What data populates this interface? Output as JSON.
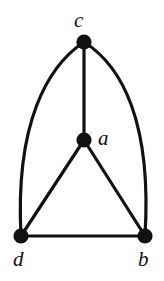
{
  "figure": {
    "kind": "undirected-graph-diagram",
    "background_color": "#ffffff",
    "ink_color": "#111111",
    "width": 164,
    "height": 281,
    "edge_stroke_width": 3.2,
    "vertex_radius": 7.6
  },
  "graph": {
    "vertices": [
      {
        "id": "c",
        "label": "c",
        "cx": 84,
        "cy": 42,
        "label_x": 74,
        "label_y": 10,
        "label_placement": "above"
      },
      {
        "id": "a",
        "label": "a",
        "cx": 84,
        "cy": 140,
        "label_x": 98,
        "label_y": 128,
        "label_placement": "right"
      },
      {
        "id": "d",
        "label": "d",
        "cx": 21,
        "cy": 236,
        "label_x": 13,
        "label_y": 249,
        "label_placement": "below"
      },
      {
        "id": "b",
        "label": "b",
        "cx": 145,
        "cy": 236,
        "label_x": 138,
        "label_y": 249,
        "label_placement": "below"
      }
    ],
    "edges": [
      {
        "id": "edge-c-a",
        "from": "c",
        "to": "a",
        "shape": "straight",
        "path": "M 84 42 L 84 140"
      },
      {
        "id": "edge-a-d",
        "from": "a",
        "to": "d",
        "shape": "straight",
        "path": "M 84 140 L 21 236"
      },
      {
        "id": "edge-a-b",
        "from": "a",
        "to": "b",
        "shape": "straight",
        "path": "M 84 140 L 145 236"
      },
      {
        "id": "edge-d-b",
        "from": "d",
        "to": "b",
        "shape": "straight",
        "path": "M 21 236 L 145 236"
      },
      {
        "id": "edge-c-d",
        "from": "c",
        "to": "d",
        "shape": "curved-left",
        "path": "M 84 42 C 48 66 15 122 21 236"
      },
      {
        "id": "edge-c-b",
        "from": "c",
        "to": "b",
        "shape": "curved-right",
        "path": "M 84 42 C 122 66 152 122 145 236"
      }
    ]
  }
}
